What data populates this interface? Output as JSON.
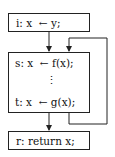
{
  "diagram": {
    "nodes": [
      {
        "id": "i",
        "label": "i: x  ← y;"
      },
      {
        "id": "s",
        "label": "s: x  ← f(x);"
      },
      {
        "id": "ellipsis",
        "label": "⋮"
      },
      {
        "id": "t",
        "label": "t: x  ← g(x);"
      },
      {
        "id": "r",
        "label": "r: return x;"
      }
    ],
    "edges": [
      {
        "from": "i",
        "to": "s"
      },
      {
        "from": "t",
        "to": "r"
      },
      {
        "from": "t",
        "to": "s",
        "type": "loop-back"
      }
    ]
  }
}
